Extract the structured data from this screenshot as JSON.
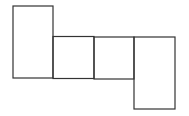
{
  "diagram": {
    "type": "net",
    "stroke_color": "#333333",
    "background": "#ffffff",
    "faces": [
      {
        "name": "face-top-left",
        "x": 13,
        "y": 6,
        "w": 40,
        "h": 72
      },
      {
        "name": "face-middle-1",
        "x": 53,
        "y": 36,
        "w": 41,
        "h": 42
      },
      {
        "name": "face-middle-2",
        "x": 94,
        "y": 37,
        "w": 40,
        "h": 42
      },
      {
        "name": "face-bottom-right",
        "x": 134,
        "y": 37,
        "w": 41,
        "h": 72
      }
    ]
  }
}
